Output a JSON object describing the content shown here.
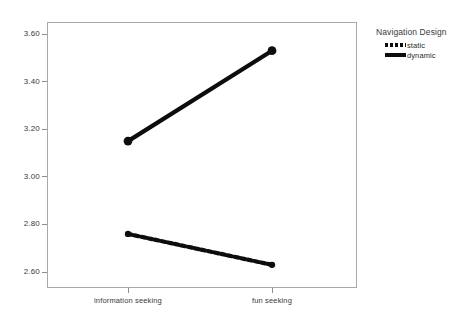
{
  "figure": {
    "top_remnant_text": "",
    "background_color": "#ffffff",
    "frame_color": "#a9a9a9",
    "series_color": "#0d0d0d"
  },
  "legend": {
    "title": "Navigation Design",
    "entries": [
      {
        "label": "static",
        "style": "dotted",
        "swatch_name": "legend-swatch-static"
      },
      {
        "label": "dynamic",
        "style": "solid",
        "swatch_name": "legend-swatch-dynamic"
      }
    ]
  },
  "y_axis": {
    "ticks": [
      "2.60",
      "2.80",
      "3.00",
      "3.20",
      "3.40",
      "3.60"
    ]
  },
  "x_axis": {
    "ticks": [
      "information seeking",
      "fun seeking"
    ]
  },
  "chart_data": {
    "type": "line",
    "title": "",
    "subtitle": "",
    "xlabel": "",
    "ylabel": "",
    "categories": [
      "information seeking",
      "fun seeking"
    ],
    "series": [
      {
        "name": "static",
        "values": [
          2.76,
          2.63
        ],
        "linestyle": "dotted",
        "color": "#0d0d0d",
        "marker": "circle"
      },
      {
        "name": "dynamic",
        "values": [
          3.15,
          3.53
        ],
        "linestyle": "solid",
        "color": "#0d0d0d",
        "marker": "circle"
      }
    ],
    "ylim": [
      2.5,
      3.66
    ],
    "yticks": [
      2.6,
      2.8,
      3.0,
      3.2,
      3.4,
      3.6
    ],
    "xlim": [
      0,
      1
    ],
    "grid": false,
    "legend_title": "Navigation Design",
    "legend_position": "right"
  }
}
